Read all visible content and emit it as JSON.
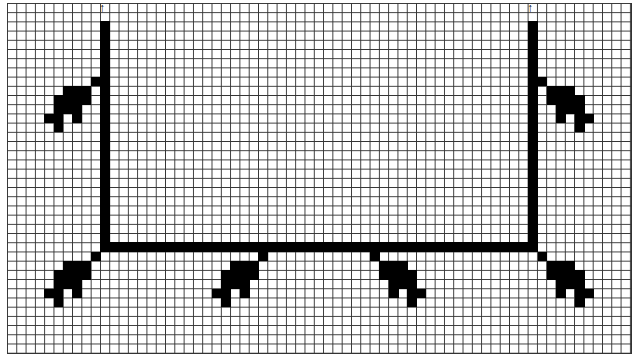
{
  "diagram": {
    "type": "pixel-grid-pattern",
    "grid": {
      "cols": 67,
      "rows": 38,
      "line_color": "#333333",
      "fill_color": "#000000",
      "background": "#ffffff"
    },
    "elements": [
      {
        "name": "left-vertical-line",
        "desc": "vertical bar col 10 rows 2-26"
      },
      {
        "name": "right-vertical-line",
        "desc": "vertical bar col 56 rows 2-26"
      },
      {
        "name": "horizontal-line",
        "desc": "horizontal bar row 26 cols 10-56"
      },
      {
        "name": "arrowheads",
        "count": 2,
        "glyph": "↑"
      },
      {
        "name": "leaf-motifs",
        "count": 6
      }
    ]
  }
}
